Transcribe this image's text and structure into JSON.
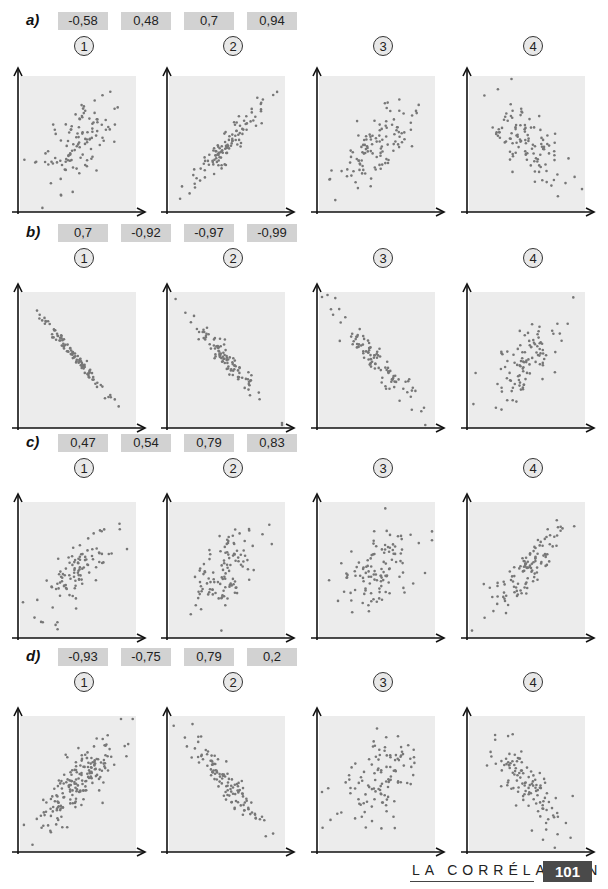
{
  "page": {
    "cut_text": "Image de petite taille",
    "footer_title": "LA CORRÉLATION",
    "page_number": "101",
    "colors": {
      "plot_bg": "#ececec",
      "dot": "#777777",
      "axis": "#111111",
      "value_box": "#d2d2d2"
    }
  },
  "rows": [
    {
      "label": "a)",
      "values": [
        "-0,58",
        "0,48",
        "0,7",
        "0,94"
      ]
    },
    {
      "label": "b)",
      "values": [
        "0,7",
        "-0,92",
        "-0,97",
        "-0,99"
      ]
    },
    {
      "label": "c)",
      "values": [
        "0,47",
        "0,54",
        "0,79",
        "0,83"
      ]
    },
    {
      "label": "d)",
      "values": [
        "-0,93",
        "-0,75",
        "0,79",
        "0,2"
      ]
    }
  ],
  "chart_data": [
    {
      "type": "scatter",
      "row": "a",
      "index": "1",
      "title": "1",
      "correlation": 0.48,
      "n": 110,
      "seed": 11
    },
    {
      "type": "scatter",
      "row": "a",
      "index": "2",
      "title": "2",
      "correlation": 0.94,
      "n": 110,
      "seed": 12
    },
    {
      "type": "scatter",
      "row": "a",
      "index": "3",
      "title": "3",
      "correlation": 0.7,
      "n": 110,
      "seed": 13
    },
    {
      "type": "scatter",
      "row": "a",
      "index": "4",
      "title": "4",
      "correlation": -0.58,
      "n": 110,
      "seed": 14
    },
    {
      "type": "scatter",
      "row": "b",
      "index": "1",
      "title": "1",
      "correlation": -0.99,
      "n": 100,
      "seed": 21
    },
    {
      "type": "scatter",
      "row": "b",
      "index": "2",
      "title": "2",
      "correlation": -0.97,
      "n": 100,
      "seed": 22
    },
    {
      "type": "scatter",
      "row": "b",
      "index": "3",
      "title": "3",
      "correlation": -0.92,
      "n": 100,
      "seed": 23
    },
    {
      "type": "scatter",
      "row": "b",
      "index": "4",
      "title": "4",
      "correlation": 0.7,
      "n": 100,
      "seed": 24
    },
    {
      "type": "scatter",
      "row": "c",
      "index": "1",
      "title": "1",
      "correlation": 0.79,
      "n": 100,
      "seed": 31
    },
    {
      "type": "scatter",
      "row": "c",
      "index": "2",
      "title": "2",
      "correlation": 0.54,
      "n": 110,
      "seed": 32
    },
    {
      "type": "scatter",
      "row": "c",
      "index": "3",
      "title": "3",
      "correlation": 0.47,
      "n": 110,
      "seed": 33
    },
    {
      "type": "scatter",
      "row": "c",
      "index": "4",
      "title": "4",
      "correlation": 0.83,
      "n": 110,
      "seed": 34
    },
    {
      "type": "scatter",
      "row": "d",
      "index": "1",
      "title": "1",
      "correlation": 0.79,
      "n": 180,
      "seed": 41
    },
    {
      "type": "scatter",
      "row": "d",
      "index": "2",
      "title": "2",
      "correlation": -0.93,
      "n": 110,
      "seed": 42
    },
    {
      "type": "scatter",
      "row": "d",
      "index": "3",
      "title": "3",
      "correlation": 0.2,
      "n": 110,
      "seed": 43
    },
    {
      "type": "scatter",
      "row": "d",
      "index": "4",
      "title": "4",
      "correlation": -0.75,
      "n": 110,
      "seed": 44
    }
  ]
}
